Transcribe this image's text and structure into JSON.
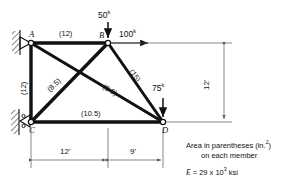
{
  "diagram": {
    "type": "truss-structural-diagram",
    "nodes": [
      {
        "id": "A",
        "label": "A",
        "x": 12,
        "y": 0
      },
      {
        "id": "B",
        "label": "B",
        "x": 0,
        "y": 0
      },
      {
        "id": "C",
        "label": "C",
        "x": 12,
        "y": 12
      },
      {
        "id": "D",
        "label": "D",
        "x": 0,
        "y": 12
      }
    ],
    "members": [
      {
        "name": "member-AB",
        "area_label": "(12)",
        "area": 12
      },
      {
        "name": "member-AC",
        "area_label": "(12)",
        "area": 12
      },
      {
        "name": "member-CB",
        "area_label": "(8.5)",
        "area": 8.5
      },
      {
        "name": "member-AD",
        "area_label": "(8.5)",
        "area": 8.5
      },
      {
        "name": "member-BD",
        "area_label": "(15)",
        "area": 15
      },
      {
        "name": "member-CD",
        "area_label": "(10.5)",
        "area": 10.5
      }
    ],
    "loads": [
      {
        "name": "load-50k-at-B",
        "value": "50",
        "unit": "k",
        "direction": "down"
      },
      {
        "name": "load-100k-at-B",
        "value": "100",
        "unit": "k",
        "direction": "right"
      },
      {
        "name": "load-75k-at-D",
        "value": "75",
        "unit": "k",
        "direction": "down"
      }
    ],
    "dimensions": [
      {
        "name": "dim-span-left",
        "label": "12'"
      },
      {
        "name": "dim-span-right",
        "label": "9'"
      },
      {
        "name": "dim-height",
        "label": "12'"
      }
    ],
    "supports": [
      {
        "name": "support-A",
        "type": "pin"
      },
      {
        "name": "support-C",
        "type": "roller"
      }
    ],
    "notes": {
      "line1_pre": "Area in parentheses (in.",
      "line1_sup": "2",
      "line1_post": ")",
      "line2": "on each member",
      "modulus_symbol": "E",
      "modulus_eq": " = 29 x 10",
      "modulus_sup": "3",
      "modulus_unit": " ksi"
    },
    "colors": {
      "member": "#111111",
      "dimension": "#555555",
      "background": "#ffffff"
    }
  }
}
